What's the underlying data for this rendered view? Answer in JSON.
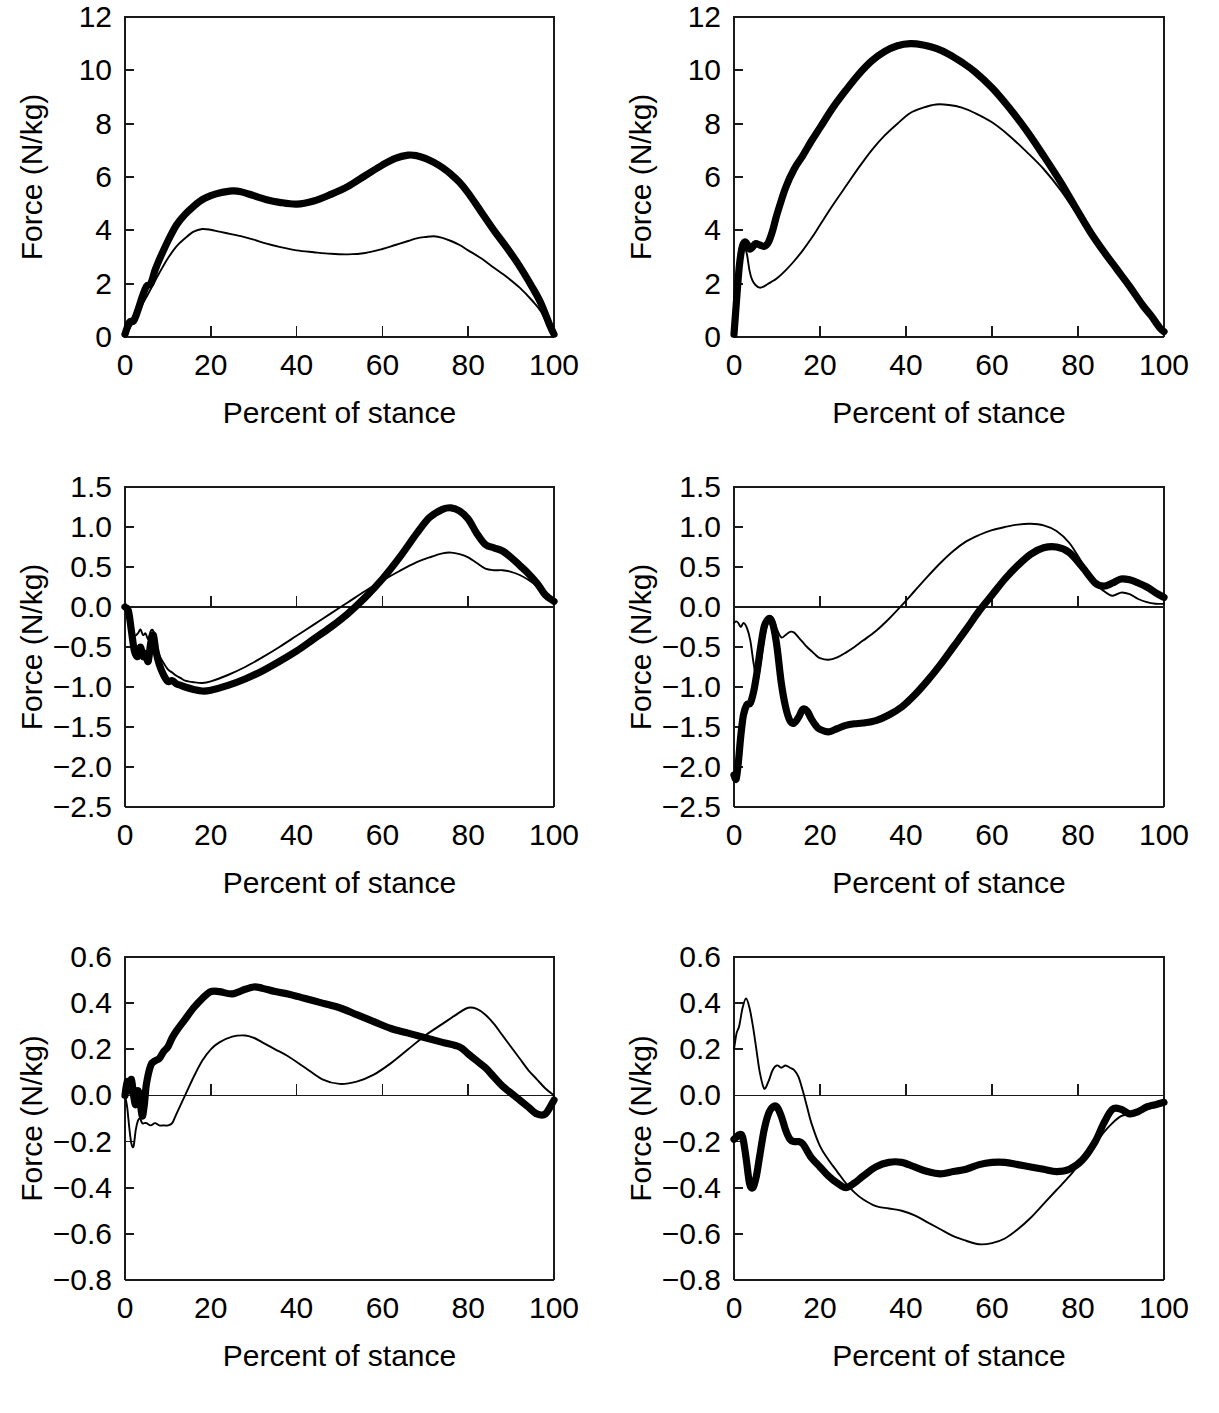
{
  "figure": {
    "axis_title_y": "Force (N/kg)",
    "axis_title_x": "Percent of stance",
    "x_ticks": [
      "0",
      "20",
      "40",
      "60",
      "80",
      "100"
    ],
    "line_styles": {
      "thick": "thick-black-line",
      "thin": "thin-black-line"
    }
  },
  "chart_data": [
    {
      "id": "panel-top-left",
      "type": "line",
      "title": "",
      "xlabel": "Percent of stance",
      "ylabel": "Force (N/kg)",
      "xlim": [
        0,
        100
      ],
      "ylim": [
        0,
        12
      ],
      "xticks": [
        0,
        20,
        40,
        60,
        80,
        100
      ],
      "yticks": [
        0,
        2,
        4,
        6,
        8,
        10,
        12
      ],
      "ytick_labels": [
        "0",
        "2",
        "4",
        "6",
        "8",
        "10",
        "12"
      ],
      "grid": false,
      "legend": "none",
      "x": [
        0,
        1,
        2,
        3,
        4,
        5,
        6,
        7,
        8,
        10,
        12,
        14,
        16,
        18,
        20,
        22,
        25,
        27,
        30,
        33,
        36,
        40,
        44,
        48,
        52,
        56,
        60,
        63,
        66,
        68,
        70,
        72,
        74,
        76,
        78,
        80,
        83,
        86,
        89,
        92,
        95,
        97,
        99,
        100
      ],
      "series": [
        {
          "name": "thick",
          "values": [
            0.1,
            0.55,
            0.6,
            1.0,
            1.5,
            1.9,
            2.0,
            2.5,
            2.9,
            3.6,
            4.2,
            4.6,
            4.9,
            5.15,
            5.3,
            5.4,
            5.48,
            5.45,
            5.3,
            5.15,
            5.05,
            4.98,
            5.1,
            5.35,
            5.65,
            6.05,
            6.45,
            6.7,
            6.82,
            6.8,
            6.7,
            6.55,
            6.35,
            6.1,
            5.8,
            5.4,
            4.7,
            4.0,
            3.35,
            2.65,
            1.85,
            1.25,
            0.45,
            0.1
          ]
        },
        {
          "name": "thin",
          "values": [
            0.05,
            0.3,
            0.6,
            0.85,
            1.2,
            1.5,
            1.8,
            2.1,
            2.4,
            2.95,
            3.4,
            3.7,
            3.95,
            4.05,
            4.02,
            3.95,
            3.85,
            3.78,
            3.65,
            3.5,
            3.38,
            3.25,
            3.18,
            3.12,
            3.1,
            3.15,
            3.3,
            3.45,
            3.6,
            3.7,
            3.75,
            3.78,
            3.72,
            3.6,
            3.45,
            3.25,
            2.95,
            2.6,
            2.25,
            1.85,
            1.35,
            0.95,
            0.3,
            0.08
          ]
        }
      ]
    },
    {
      "id": "panel-top-right",
      "type": "line",
      "title": "",
      "xlabel": "Percent of stance",
      "ylabel": "Force (N/kg)",
      "xlim": [
        0,
        100
      ],
      "ylim": [
        0,
        12
      ],
      "xticks": [
        0,
        20,
        40,
        60,
        80,
        100
      ],
      "yticks": [
        0,
        2,
        4,
        6,
        8,
        10,
        12
      ],
      "ytick_labels": [
        "0",
        "2",
        "4",
        "6",
        "8",
        "10",
        "12"
      ],
      "grid": false,
      "legend": "none",
      "x": [
        0,
        0.6,
        1.2,
        1.8,
        2.4,
        3,
        3.6,
        4.2,
        5,
        6,
        7,
        8,
        9,
        10,
        12,
        14,
        16,
        18,
        20,
        23,
        26,
        29,
        32,
        35,
        38,
        41,
        44,
        47,
        50,
        53,
        56,
        60,
        64,
        68,
        72,
        76,
        80,
        83,
        86,
        89,
        92,
        95,
        97,
        99,
        100
      ],
      "series": [
        {
          "name": "thick",
          "values": [
            0.1,
            1.4,
            2.6,
            3.3,
            3.55,
            3.5,
            3.3,
            3.35,
            3.5,
            3.45,
            3.4,
            3.55,
            4.0,
            4.6,
            5.6,
            6.3,
            6.8,
            7.35,
            7.85,
            8.6,
            9.25,
            9.85,
            10.35,
            10.7,
            10.92,
            11.0,
            10.95,
            10.82,
            10.6,
            10.3,
            9.95,
            9.35,
            8.6,
            7.75,
            6.8,
            5.8,
            4.7,
            3.9,
            3.2,
            2.55,
            1.9,
            1.2,
            0.8,
            0.35,
            0.2
          ]
        },
        {
          "name": "thin",
          "values": [
            0.1,
            1.3,
            2.4,
            3.1,
            3.35,
            3.1,
            2.5,
            2.15,
            1.95,
            1.85,
            1.9,
            2.0,
            2.1,
            2.2,
            2.5,
            2.85,
            3.25,
            3.7,
            4.2,
            4.95,
            5.65,
            6.35,
            7.0,
            7.55,
            8.0,
            8.4,
            8.6,
            8.72,
            8.7,
            8.6,
            8.4,
            8.05,
            7.55,
            6.95,
            6.3,
            5.5,
            4.55,
            3.85,
            3.15,
            2.5,
            1.85,
            1.15,
            0.7,
            0.3,
            0.18
          ]
        }
      ]
    },
    {
      "id": "panel-middle-left",
      "type": "line",
      "title": "",
      "xlabel": "Percent of stance",
      "ylabel": "Force (N/kg)",
      "xlim": [
        0,
        100
      ],
      "ylim": [
        -2.5,
        1.5
      ],
      "xticks": [
        0,
        20,
        40,
        60,
        80,
        100
      ],
      "yticks": [
        -2.5,
        -2.0,
        -1.5,
        -1.0,
        -0.5,
        0.0,
        0.5,
        1.0,
        1.5
      ],
      "ytick_labels": [
        "−2.5",
        "−2.0",
        "−1.5",
        "−1.0",
        "−0.5",
        "0.0",
        "0.5",
        "1.0",
        "1.5"
      ],
      "grid": false,
      "legend": "none",
      "x": [
        0,
        0.8,
        1.5,
        2.2,
        3,
        3.6,
        4.2,
        4.8,
        5.4,
        6,
        6.6,
        7.2,
        8,
        9,
        10,
        11,
        12,
        13,
        14,
        16,
        18,
        20,
        24,
        28,
        32,
        36,
        40,
        44,
        48,
        52,
        56,
        60,
        64,
        68,
        71,
        74,
        76,
        78,
        80,
        82,
        84,
        86,
        88,
        90,
        92,
        94,
        96,
        98,
        100
      ],
      "series": [
        {
          "name": "thick",
          "values": [
            0.0,
            -0.05,
            -0.3,
            -0.55,
            -0.62,
            -0.5,
            -0.62,
            -0.58,
            -0.68,
            -0.45,
            -0.35,
            -0.55,
            -0.72,
            -0.85,
            -0.93,
            -0.92,
            -0.96,
            -0.98,
            -1.0,
            -1.03,
            -1.05,
            -1.04,
            -0.98,
            -0.9,
            -0.8,
            -0.68,
            -0.55,
            -0.4,
            -0.25,
            -0.08,
            0.12,
            0.35,
            0.62,
            0.92,
            1.12,
            1.22,
            1.24,
            1.2,
            1.1,
            0.92,
            0.78,
            0.74,
            0.7,
            0.62,
            0.52,
            0.42,
            0.3,
            0.15,
            0.07
          ]
        },
        {
          "name": "thin",
          "values": [
            0.0,
            -0.05,
            -0.2,
            -0.35,
            -0.33,
            -0.28,
            -0.35,
            -0.33,
            -0.4,
            -0.3,
            -0.3,
            -0.45,
            -0.6,
            -0.7,
            -0.78,
            -0.82,
            -0.86,
            -0.89,
            -0.92,
            -0.94,
            -0.95,
            -0.93,
            -0.85,
            -0.75,
            -0.63,
            -0.5,
            -0.36,
            -0.22,
            -0.08,
            0.06,
            0.2,
            0.33,
            0.45,
            0.56,
            0.62,
            0.67,
            0.68,
            0.66,
            0.62,
            0.55,
            0.48,
            0.46,
            0.46,
            0.44,
            0.4,
            0.34,
            0.26,
            0.15,
            0.07
          ]
        }
      ]
    },
    {
      "id": "panel-middle-right",
      "type": "line",
      "title": "",
      "xlabel": "Percent of stance",
      "ylabel": "Force (N/kg)",
      "xlim": [
        0,
        100
      ],
      "ylim": [
        -2.5,
        1.5
      ],
      "xticks": [
        0,
        20,
        40,
        60,
        80,
        100
      ],
      "yticks": [
        -2.5,
        -2.0,
        -1.5,
        -1.0,
        -0.5,
        0.0,
        0.5,
        1.0,
        1.5
      ],
      "ytick_labels": [
        "−2.5",
        "−2.0",
        "−1.5",
        "−1.0",
        "−0.5",
        "0.0",
        "0.5",
        "1.0",
        "1.5"
      ],
      "grid": false,
      "legend": "none",
      "x": [
        0,
        0.5,
        1,
        1.6,
        2.2,
        3,
        3.8,
        4.6,
        5.4,
        6.2,
        7,
        7.8,
        8.5,
        9.2,
        10,
        11,
        12,
        13,
        14,
        15,
        16,
        17,
        18,
        19,
        20,
        22,
        24,
        26,
        28,
        30,
        33,
        36,
        39,
        42,
        45,
        48,
        51,
        54,
        57,
        60,
        63,
        66,
        69,
        72,
        75,
        78,
        81,
        84,
        86,
        88,
        90,
        92,
        94,
        96,
        98,
        100
      ],
      "series": [
        {
          "name": "thick",
          "values": [
            -2.1,
            -2.15,
            -1.95,
            -1.6,
            -1.35,
            -1.22,
            -1.2,
            -1.05,
            -0.8,
            -0.5,
            -0.25,
            -0.16,
            -0.15,
            -0.25,
            -0.5,
            -0.95,
            -1.25,
            -1.42,
            -1.45,
            -1.38,
            -1.28,
            -1.3,
            -1.4,
            -1.48,
            -1.53,
            -1.56,
            -1.52,
            -1.48,
            -1.46,
            -1.45,
            -1.42,
            -1.35,
            -1.25,
            -1.1,
            -0.92,
            -0.72,
            -0.5,
            -0.28,
            -0.05,
            0.15,
            0.35,
            0.52,
            0.66,
            0.74,
            0.75,
            0.68,
            0.5,
            0.3,
            0.26,
            0.3,
            0.35,
            0.34,
            0.3,
            0.25,
            0.18,
            0.12
          ]
        },
        {
          "name": "thin",
          "values": [
            -0.2,
            -0.18,
            -0.2,
            -0.25,
            -0.2,
            -0.26,
            -0.42,
            -0.72,
            -0.92,
            -0.7,
            -0.4,
            -0.2,
            -0.12,
            -0.16,
            -0.28,
            -0.38,
            -0.35,
            -0.31,
            -0.32,
            -0.38,
            -0.44,
            -0.5,
            -0.55,
            -0.6,
            -0.64,
            -0.66,
            -0.63,
            -0.57,
            -0.5,
            -0.42,
            -0.3,
            -0.15,
            0.02,
            0.2,
            0.38,
            0.55,
            0.7,
            0.82,
            0.9,
            0.96,
            1.0,
            1.03,
            1.04,
            1.02,
            0.95,
            0.8,
            0.55,
            0.3,
            0.2,
            0.14,
            0.18,
            0.16,
            0.1,
            0.06,
            0.04,
            0.04
          ]
        }
      ]
    },
    {
      "id": "panel-bottom-left",
      "type": "line",
      "title": "",
      "xlabel": "Percent of stance",
      "ylabel": "Force (N/kg)",
      "xlim": [
        0,
        100
      ],
      "ylim": [
        -0.8,
        0.6
      ],
      "xticks": [
        0,
        20,
        40,
        60,
        80,
        100
      ],
      "yticks": [
        -0.8,
        -0.6,
        -0.4,
        -0.2,
        0.0,
        0.2,
        0.4,
        0.6
      ],
      "ytick_labels": [
        "−0.8",
        "−0.6",
        "−0.4",
        "−0.2",
        "0.0",
        "0.2",
        "0.4",
        "0.6"
      ],
      "grid": false,
      "legend": "none",
      "x": [
        0,
        0.5,
        1,
        1.5,
        2,
        2.5,
        3,
        3.5,
        4,
        4.5,
        5,
        6,
        7,
        8,
        9,
        10,
        11,
        12,
        14,
        16,
        18,
        20,
        22,
        25,
        28,
        30,
        32,
        35,
        38,
        42,
        46,
        50,
        54,
        58,
        62,
        66,
        70,
        74,
        78,
        80,
        82,
        84,
        86,
        88,
        90,
        92,
        94,
        96,
        98,
        100
      ],
      "series": [
        {
          "name": "thick",
          "values": [
            0.0,
            0.06,
            0.02,
            0.07,
            0.0,
            -0.04,
            0.02,
            -0.02,
            -0.09,
            -0.04,
            0.05,
            0.13,
            0.15,
            0.16,
            0.19,
            0.21,
            0.25,
            0.28,
            0.33,
            0.38,
            0.42,
            0.45,
            0.45,
            0.44,
            0.46,
            0.47,
            0.465,
            0.45,
            0.44,
            0.42,
            0.4,
            0.38,
            0.35,
            0.32,
            0.29,
            0.27,
            0.25,
            0.23,
            0.21,
            0.18,
            0.15,
            0.12,
            0.08,
            0.04,
            0.01,
            -0.02,
            -0.05,
            -0.08,
            -0.08,
            -0.02
          ]
        },
        {
          "name": "thin",
          "values": [
            0.0,
            -0.05,
            -0.14,
            -0.21,
            -0.22,
            -0.15,
            -0.11,
            -0.1,
            -0.12,
            -0.12,
            -0.12,
            -0.13,
            -0.12,
            -0.13,
            -0.13,
            -0.13,
            -0.12,
            -0.08,
            0.0,
            0.08,
            0.15,
            0.2,
            0.23,
            0.255,
            0.26,
            0.25,
            0.23,
            0.2,
            0.17,
            0.12,
            0.07,
            0.05,
            0.06,
            0.09,
            0.14,
            0.2,
            0.26,
            0.31,
            0.36,
            0.38,
            0.375,
            0.35,
            0.31,
            0.26,
            0.21,
            0.16,
            0.11,
            0.07,
            0.03,
            0.0
          ]
        }
      ]
    },
    {
      "id": "panel-bottom-right",
      "type": "line",
      "title": "",
      "xlabel": "Percent of stance",
      "ylabel": "Force (N/kg)",
      "xlim": [
        0,
        100
      ],
      "ylim": [
        -0.8,
        0.6
      ],
      "xticks": [
        0,
        20,
        40,
        60,
        80,
        100
      ],
      "yticks": [
        -0.8,
        -0.6,
        -0.4,
        -0.2,
        0.0,
        0.2,
        0.4,
        0.6
      ],
      "ytick_labels": [
        "−0.8",
        "−0.6",
        "−0.4",
        "−0.2",
        "0.0",
        "0.2",
        "0.4",
        "0.6"
      ],
      "grid": false,
      "legend": "none",
      "x": [
        0,
        0.6,
        1.2,
        2,
        2.8,
        3.6,
        4.4,
        5.2,
        6,
        7,
        8,
        9,
        10,
        11,
        12,
        13,
        14,
        15,
        16,
        17,
        18,
        20,
        22,
        24,
        26,
        28,
        30,
        33,
        36,
        39,
        42,
        45,
        48,
        51,
        54,
        57,
        60,
        63,
        66,
        69,
        72,
        75,
        78,
        81,
        84,
        86,
        88,
        90,
        92,
        94,
        96,
        98,
        100
      ],
      "series": [
        {
          "name": "thick",
          "values": [
            -0.19,
            -0.18,
            -0.17,
            -0.18,
            -0.27,
            -0.38,
            -0.4,
            -0.35,
            -0.26,
            -0.15,
            -0.08,
            -0.05,
            -0.05,
            -0.09,
            -0.15,
            -0.19,
            -0.2,
            -0.2,
            -0.21,
            -0.24,
            -0.27,
            -0.31,
            -0.35,
            -0.38,
            -0.4,
            -0.38,
            -0.35,
            -0.31,
            -0.29,
            -0.29,
            -0.31,
            -0.33,
            -0.34,
            -0.33,
            -0.32,
            -0.3,
            -0.29,
            -0.29,
            -0.3,
            -0.31,
            -0.32,
            -0.33,
            -0.32,
            -0.28,
            -0.2,
            -0.12,
            -0.06,
            -0.06,
            -0.08,
            -0.07,
            -0.05,
            -0.04,
            -0.03
          ]
        },
        {
          "name": "thin",
          "values": [
            0.2,
            0.27,
            0.3,
            0.38,
            0.42,
            0.38,
            0.3,
            0.2,
            0.1,
            0.03,
            0.06,
            0.11,
            0.13,
            0.12,
            0.13,
            0.12,
            0.11,
            0.08,
            0.02,
            -0.05,
            -0.12,
            -0.22,
            -0.28,
            -0.33,
            -0.38,
            -0.42,
            -0.45,
            -0.48,
            -0.49,
            -0.5,
            -0.52,
            -0.55,
            -0.58,
            -0.61,
            -0.63,
            -0.645,
            -0.64,
            -0.62,
            -0.58,
            -0.53,
            -0.47,
            -0.41,
            -0.35,
            -0.28,
            -0.21,
            -0.16,
            -0.12,
            -0.09,
            -0.08,
            -0.07,
            -0.06,
            -0.05,
            -0.04
          ]
        }
      ]
    }
  ]
}
